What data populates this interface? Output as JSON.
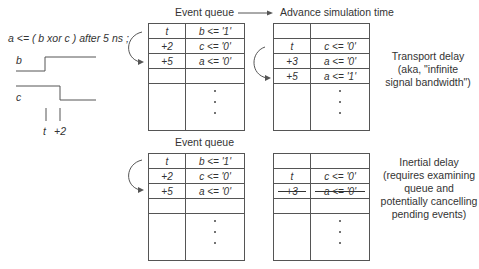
{
  "statement": "a <=  ( b xor c )  after 5 ns ;",
  "waveform": {
    "signal_b_label": "b",
    "signal_c_label": "c",
    "time_marks": [
      "t",
      "+2"
    ]
  },
  "top": {
    "queue_title": "Event queue",
    "advance_label": "Advance simulation time",
    "before_queue": {
      "rows": [
        {
          "time": "t",
          "event": "b <= '1'"
        },
        {
          "time": "+2",
          "event": "c <= '0'"
        },
        {
          "time": "+5",
          "event": "a <= '0'"
        },
        {
          "time": "",
          "event": ""
        }
      ],
      "continuation": "⋮"
    },
    "after_queue": {
      "rows": [
        {
          "time": "",
          "event": ""
        },
        {
          "time": "t",
          "event": "c <= '0'"
        },
        {
          "time": "+3",
          "event": "a <= '0'"
        },
        {
          "time": "+5",
          "event": "a <= '1'"
        }
      ],
      "continuation": "⋮"
    },
    "note": [
      "Transport delay",
      "(aka, \"infinite",
      "signal bandwidth\")"
    ]
  },
  "bottom": {
    "queue_title": "Event queue",
    "before_queue": {
      "rows": [
        {
          "time": "t",
          "event": "b <= '1'"
        },
        {
          "time": "+2",
          "event": "c <= '0'"
        },
        {
          "time": "+5",
          "event": "a <= '0'"
        },
        {
          "time": "",
          "event": ""
        }
      ],
      "continuation": "⋮"
    },
    "after_queue": {
      "rows": [
        {
          "time": "",
          "event": ""
        },
        {
          "time": "t",
          "event": "c <= '0'"
        },
        {
          "time": "+3",
          "event": "a <= '0'",
          "cancelled": true
        },
        {
          "time": "",
          "event": ""
        }
      ],
      "continuation": "⋮"
    },
    "note": [
      "Inertial delay",
      "(requires examining",
      "queue and",
      "potentially cancelling",
      "pending events)"
    ]
  },
  "colors": {
    "line": "#555555",
    "text": "#333333",
    "background": "#ffffff"
  }
}
